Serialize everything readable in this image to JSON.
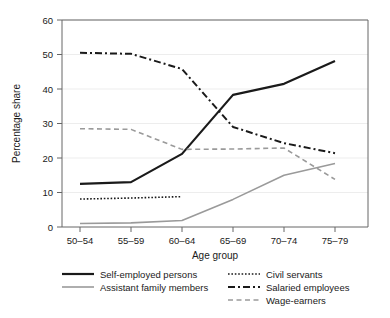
{
  "chart_data": {
    "type": "line",
    "title": "",
    "xlabel": "Age group",
    "ylabel": "Percentage share",
    "categories": [
      "50–54",
      "55–59",
      "60–64",
      "65–69",
      "70–74",
      "75–79"
    ],
    "ylim": [
      0,
      60
    ],
    "yticks": [
      0,
      10,
      20,
      30,
      40,
      50,
      60
    ],
    "ytick_labels": [
      "0",
      "10",
      "20",
      "30",
      "40",
      "50",
      "60"
    ],
    "grid": true,
    "grid_axis": "y",
    "legend_position": "below",
    "series": [
      {
        "name": "Self-employed persons",
        "values": [
          12.5,
          13.0,
          21.2,
          38.3,
          41.5,
          48.1
        ],
        "color": "#1a1a1a",
        "style": "solid",
        "width": 2.2,
        "dash": ""
      },
      {
        "name": "Assistant family members",
        "values": [
          1.0,
          1.2,
          1.9,
          8.0,
          15.0,
          18.4
        ],
        "color": "#9a9a9a",
        "style": "solid",
        "width": 1.6,
        "dash": ""
      },
      {
        "name": "Civil servants",
        "values": [
          8.1,
          8.4,
          8.8,
          null,
          null,
          null
        ],
        "color": "#1a1a1a",
        "style": "dotted",
        "width": 1.6,
        "dash": "1.6 1.8"
      },
      {
        "name": "Salaried employees",
        "values": [
          50.5,
          50.2,
          45.8,
          29.0,
          24.3,
          21.4
        ],
        "color": "#1a1a1a",
        "style": "dash-dot",
        "width": 2.0,
        "dash": "7 3 2 3"
      },
      {
        "name": "Wage-earners",
        "values": [
          28.5,
          28.3,
          22.5,
          22.6,
          22.9,
          13.8
        ],
        "color": "#9a9a9a",
        "style": "dashed",
        "width": 1.6,
        "dash": "5 3.5"
      }
    ]
  },
  "axes": {
    "ylabel": "Percentage share",
    "xlabel": "Age group",
    "ytick_0": "0",
    "ytick_10": "10",
    "ytick_20": "20",
    "ytick_30": "30",
    "ytick_40": "40",
    "ytick_50": "50",
    "ytick_60": "60",
    "xtick_0": "50–54",
    "xtick_1": "55–59",
    "xtick_2": "60–64",
    "xtick_3": "65–69",
    "xtick_4": "70–74",
    "xtick_5": "75–79"
  },
  "legend": {
    "entries": [
      {
        "label": "Self-employed persons",
        "column": 0,
        "row": 0
      },
      {
        "label": "Assistant family members",
        "column": 0,
        "row": 1
      },
      {
        "label": "Civil servants",
        "column": 1,
        "row": 0
      },
      {
        "label": "Salaried employees",
        "column": 1,
        "row": 1
      },
      {
        "label": "Wage-earners",
        "column": 1,
        "row": 2
      }
    ]
  },
  "colors": {
    "dark": "#1a1a1a",
    "gray": "#9a9a9a",
    "grid": "#e6e6e6",
    "frame": "#555555",
    "background": "#ffffff"
  }
}
